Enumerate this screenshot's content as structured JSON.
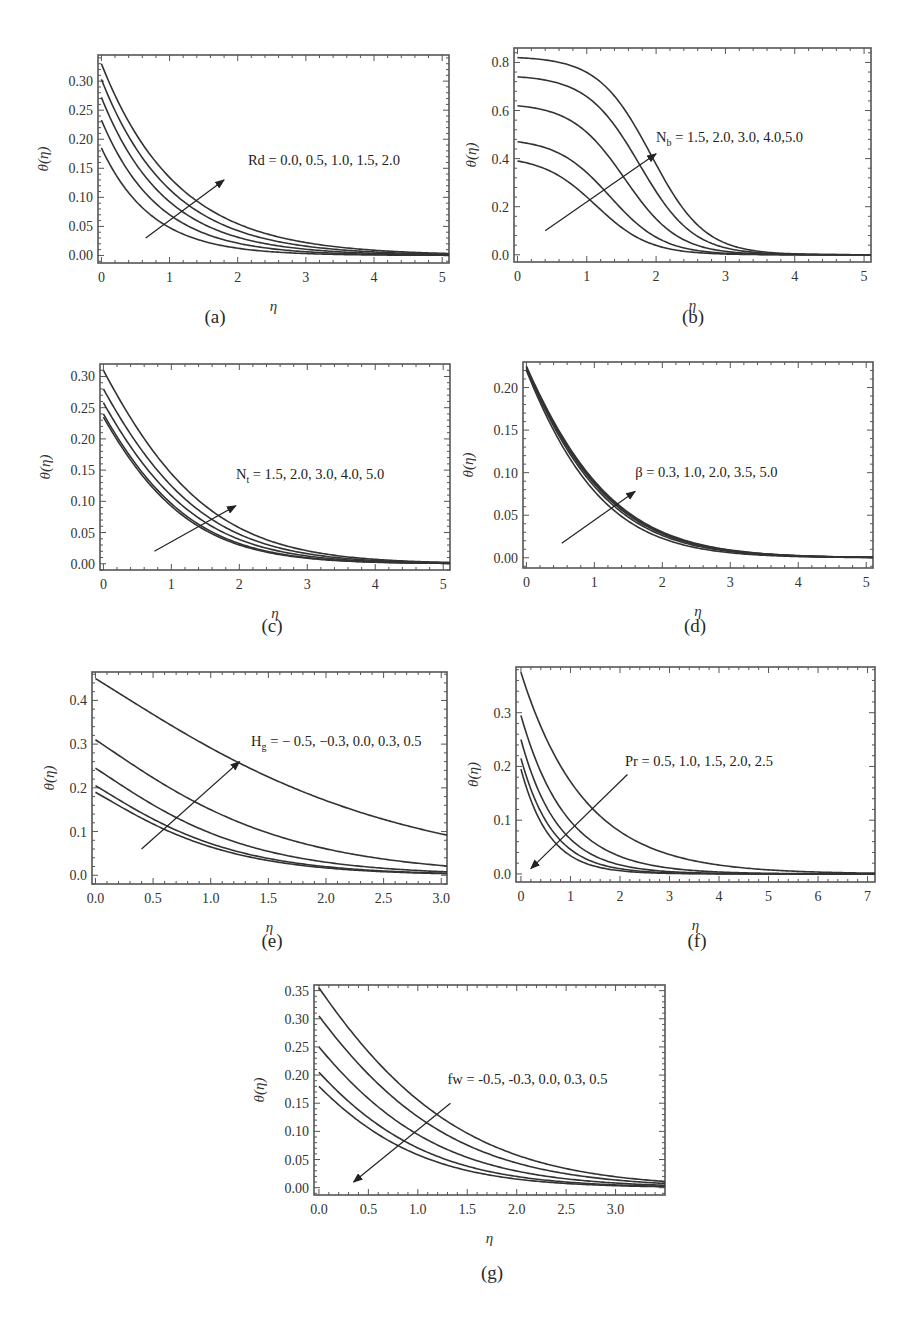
{
  "figure": {
    "captions": [
      "(a)",
      "(b)",
      "(c)",
      "(d)",
      "(e)",
      "(f)",
      "(g)"
    ]
  },
  "chart_data": [
    {
      "id": "a",
      "type": "line",
      "caption": "(a)",
      "xlabel": "η",
      "ylabel": "θ(η)",
      "frame": {
        "left": 98,
        "top": 55,
        "right": 449,
        "bottom": 263
      },
      "xlim": [
        -0.05,
        5.1
      ],
      "ylim": [
        -0.013,
        0.345
      ],
      "xticks": [
        0,
        1,
        2,
        3,
        4,
        5
      ],
      "xtick_labels": [
        "0",
        "1",
        "2",
        "3",
        "4",
        "5"
      ],
      "yticks": [
        0.0,
        0.05,
        0.1,
        0.15,
        0.2,
        0.25,
        0.3
      ],
      "ytick_labels": [
        "0.00",
        "0.05",
        "0.10",
        "0.15",
        "0.20",
        "0.25",
        "0.30"
      ],
      "legend": {
        "text": "Rd = 0.0, 0.5, 1.0, 1.5, 2.0",
        "x": 2.15,
        "y": 0.155,
        "sub": null
      },
      "arrow": {
        "from": [
          0.65,
          0.03
        ],
        "to": [
          1.8,
          0.13
        ],
        "direction": "increasing"
      },
      "parameter": "Rd",
      "parameter_values": [
        0.0,
        0.5,
        1.0,
        1.5,
        2.0
      ],
      "curve_model": "exp",
      "series": [
        {
          "name": "Rd = 0.0",
          "theta0": 0.185,
          "k": 1.35
        },
        {
          "name": "Rd = 0.5",
          "theta0": 0.233,
          "k": 1.2
        },
        {
          "name": "Rd = 1.0",
          "theta0": 0.272,
          "k": 1.08
        },
        {
          "name": "Rd = 1.5",
          "theta0": 0.303,
          "k": 0.98
        },
        {
          "name": "Rd = 2.0",
          "theta0": 0.33,
          "k": 0.9
        }
      ]
    },
    {
      "id": "b",
      "type": "line",
      "caption": "(b)",
      "xlabel": "η",
      "ylabel": "θ(η)",
      "frame": {
        "left": 514,
        "top": 48,
        "right": 871,
        "bottom": 262
      },
      "xlim": [
        -0.05,
        5.1
      ],
      "ylim": [
        -0.03,
        0.86
      ],
      "xticks": [
        0,
        1,
        2,
        3,
        4,
        5
      ],
      "xtick_labels": [
        "0",
        "1",
        "2",
        "3",
        "4",
        "5"
      ],
      "yticks": [
        0.0,
        0.2,
        0.4,
        0.6,
        0.8
      ],
      "ytick_labels": [
        "0.0",
        "0.2",
        "0.4",
        "0.6",
        "0.8"
      ],
      "legend": {
        "text": "N",
        "sub": "b",
        "rest": " = 1.5, 2.0, 3.0, 4.0,5.0",
        "x": 2.0,
        "y": 0.47
      },
      "arrow": {
        "from": [
          0.4,
          0.1
        ],
        "to": [
          2.0,
          0.42
        ],
        "direction": "increasing"
      },
      "parameter": "Nb",
      "parameter_values": [
        1.5,
        2.0,
        3.0,
        4.0,
        5.0
      ],
      "curve_model": "gauss",
      "series": [
        {
          "name": "Nb = 1.5",
          "theta0": 0.39,
          "k": 0.95
        },
        {
          "name": "Nb = 2.0",
          "theta0": 0.47,
          "k": 1.12
        },
        {
          "name": "Nb = 3.0",
          "theta0": 0.62,
          "k": 1.3
        },
        {
          "name": "Nb = 4.0",
          "theta0": 0.74,
          "k": 1.48
        },
        {
          "name": "Nb = 5.0",
          "theta0": 0.82,
          "k": 1.62
        }
      ]
    },
    {
      "id": "c",
      "type": "line",
      "caption": "(c)",
      "xlabel": "η",
      "ylabel": "θ(η)",
      "frame": {
        "left": 100,
        "top": 364,
        "right": 450,
        "bottom": 570
      },
      "xlim": [
        -0.05,
        5.1
      ],
      "ylim": [
        -0.01,
        0.32
      ],
      "xticks": [
        0,
        1,
        2,
        3,
        4,
        5
      ],
      "xtick_labels": [
        "0",
        "1",
        "2",
        "3",
        "4",
        "5"
      ],
      "yticks": [
        0.0,
        0.05,
        0.1,
        0.15,
        0.2,
        0.25,
        0.3
      ],
      "ytick_labels": [
        "0.00",
        "0.05",
        "0.10",
        "0.15",
        "0.20",
        "0.25",
        "0.30"
      ],
      "legend": {
        "text": "N",
        "sub": "t",
        "rest": " = 1.5, 2.0, 3.0, 4.0, 5.0",
        "x": 1.95,
        "y": 0.135
      },
      "arrow": {
        "from": [
          0.75,
          0.02
        ],
        "to": [
          1.95,
          0.093
        ],
        "direction": "increasing"
      },
      "parameter": "Nt",
      "parameter_values": [
        1.5,
        2.0,
        3.0,
        4.0,
        5.0
      ],
      "curve_model": "exp2",
      "series": [
        {
          "name": "Nt = 1.5",
          "theta0": 0.235,
          "k": 1.25
        },
        {
          "name": "Nt = 2.0",
          "theta0": 0.24,
          "k": 1.22
        },
        {
          "name": "Nt = 3.0",
          "theta0": 0.258,
          "k": 1.15
        },
        {
          "name": "Nt = 4.0",
          "theta0": 0.28,
          "k": 1.08
        },
        {
          "name": "Nt = 5.0",
          "theta0": 0.31,
          "k": 1.02
        }
      ]
    },
    {
      "id": "d",
      "type": "line",
      "caption": "(d)",
      "xlabel": "η",
      "ylabel": "θ(η)",
      "frame": {
        "left": 523,
        "top": 362,
        "right": 873,
        "bottom": 568
      },
      "xlim": [
        -0.05,
        5.1
      ],
      "ylim": [
        -0.012,
        0.23
      ],
      "xticks": [
        0,
        1,
        2,
        3,
        4,
        5
      ],
      "xtick_labels": [
        "0",
        "1",
        "2",
        "3",
        "4",
        "5"
      ],
      "yticks": [
        0.0,
        0.05,
        0.1,
        0.15,
        0.2
      ],
      "ytick_labels": [
        "0.00",
        "0.05",
        "0.10",
        "0.15",
        "0.20"
      ],
      "legend": {
        "text": "β = 0.3, 1.0, 2.0, 3.5, 5.0",
        "x": 1.6,
        "y": 0.095,
        "sub": null
      },
      "arrow": {
        "from": [
          0.52,
          0.017
        ],
        "to": [
          1.6,
          0.078
        ],
        "direction": "increasing"
      },
      "parameter": "β",
      "parameter_values": [
        0.3,
        1.0,
        2.0,
        3.5,
        5.0
      ],
      "curve_model": "exp2",
      "series": [
        {
          "name": "β = 0.3",
          "theta0": 0.22,
          "k": 1.38
        },
        {
          "name": "β = 1.0",
          "theta0": 0.222,
          "k": 1.3
        },
        {
          "name": "β = 2.0",
          "theta0": 0.223,
          "k": 1.26
        },
        {
          "name": "β = 3.5",
          "theta0": 0.224,
          "k": 1.24
        },
        {
          "name": "β = 5.0",
          "theta0": 0.225,
          "k": 1.22
        }
      ]
    },
    {
      "id": "e",
      "type": "line",
      "caption": "(e)",
      "xlabel": "η",
      "ylabel": "θ(η)",
      "frame": {
        "left": 92,
        "top": 672,
        "right": 447,
        "bottom": 884
      },
      "xlim": [
        -0.03,
        3.05
      ],
      "ylim": [
        -0.02,
        0.465
      ],
      "xticks": [
        0,
        0.5,
        1.0,
        1.5,
        2.0,
        2.5,
        3.0
      ],
      "xtick_labels": [
        "0.0",
        "0.5",
        "1.0",
        "1.5",
        "2.0",
        "2.5",
        "3.0"
      ],
      "yticks": [
        0.0,
        0.1,
        0.2,
        0.3,
        0.4
      ],
      "ytick_labels": [
        "0.0",
        "0.1",
        "0.2",
        "0.3",
        "0.4"
      ],
      "legend": {
        "text": "H",
        "sub": "g",
        "rest": " = − 0.5,  −0.3,  0.0,  0.3,  0.5",
        "x": 1.35,
        "y": 0.295
      },
      "arrow": {
        "from": [
          0.4,
          0.06
        ],
        "to": [
          1.25,
          0.26
        ],
        "direction": "increasing"
      },
      "parameter": "Hg",
      "parameter_values": [
        -0.5,
        -0.3,
        0.0,
        0.3,
        0.5
      ],
      "curve_model": "mix",
      "series": [
        {
          "name": "Hg = -0.5",
          "theta0": 0.19,
          "k": 1.75
        },
        {
          "name": "Hg = -0.3",
          "theta0": 0.205,
          "k": 1.7
        },
        {
          "name": "Hg = 0.0",
          "theta0": 0.245,
          "k": 1.55
        },
        {
          "name": "Hg = 0.3",
          "theta0": 0.31,
          "k": 1.25
        },
        {
          "name": "Hg = 0.5",
          "theta0": 0.45,
          "k": 0.8
        }
      ]
    },
    {
      "id": "f",
      "type": "line",
      "caption": "(f)",
      "xlabel": "η",
      "ylabel": "θ(η)",
      "frame": {
        "left": 516,
        "top": 667,
        "right": 875,
        "bottom": 882
      },
      "xlim": [
        -0.1,
        7.15
      ],
      "ylim": [
        -0.015,
        0.385
      ],
      "xticks": [
        0,
        1,
        2,
        3,
        4,
        5,
        6,
        7
      ],
      "xtick_labels": [
        "0",
        "1",
        "2",
        "3",
        "4",
        "5",
        "6",
        "7"
      ],
      "yticks": [
        0.0,
        0.1,
        0.2,
        0.3
      ],
      "ytick_labels": [
        "0.0",
        "0.1",
        "0.2",
        "0.3"
      ],
      "legend": {
        "text": "Pr = 0.5, 1.0, 1.5, 2.0, 2.5",
        "x": 2.1,
        "y": 0.2,
        "sub": null
      },
      "arrow": {
        "from": [
          2.15,
          0.185
        ],
        "to": [
          0.2,
          0.01
        ],
        "direction": "decreasing"
      },
      "parameter": "Pr",
      "parameter_values": [
        0.5,
        1.0,
        1.5,
        2.0,
        2.5
      ],
      "curve_model": "exp",
      "series": [
        {
          "name": "Pr = 0.5",
          "theta0": 0.375,
          "k": 0.78
        },
        {
          "name": "Pr = 1.0",
          "theta0": 0.295,
          "k": 1.1
        },
        {
          "name": "Pr = 1.5",
          "theta0": 0.25,
          "k": 1.35
        },
        {
          "name": "Pr = 2.0",
          "theta0": 0.215,
          "k": 1.55
        },
        {
          "name": "Pr = 2.5",
          "theta0": 0.195,
          "k": 1.75
        }
      ]
    },
    {
      "id": "g",
      "type": "line",
      "caption": "(g)",
      "xlabel": "η",
      "ylabel": "θ(η)",
      "frame": {
        "left": 314,
        "top": 985,
        "right": 665,
        "bottom": 1195
      },
      "xlim": [
        -0.05,
        3.5
      ],
      "ylim": [
        -0.013,
        0.36
      ],
      "xticks": [
        0,
        0.5,
        1.0,
        1.5,
        2.0,
        2.5,
        3.0
      ],
      "xtick_labels": [
        "0.0",
        "0.5",
        "1.0",
        "1.5",
        "2.0",
        "2.5",
        "3.0"
      ],
      "yticks": [
        0.0,
        0.05,
        0.1,
        0.15,
        0.2,
        0.25,
        0.3,
        0.35
      ],
      "ytick_labels": [
        "0.00",
        "0.05",
        "0.10",
        "0.15",
        "0.20",
        "0.25",
        "0.30",
        "0.35"
      ],
      "legend": {
        "text": "fw = -0.5, -0.3, 0.0, 0.3, 0.5",
        "x": 1.3,
        "y": 0.185,
        "sub": null
      },
      "arrow": {
        "from": [
          1.33,
          0.15
        ],
        "to": [
          0.35,
          0.01
        ],
        "direction": "decreasing"
      },
      "parameter": "fw",
      "parameter_values": [
        -0.5,
        -0.3,
        0.0,
        0.3,
        0.5
      ],
      "curve_model": "exp2",
      "series": [
        {
          "name": "fw = 0.5",
          "theta0": 0.18,
          "k": 1.5
        },
        {
          "name": "fw = 0.3",
          "theta0": 0.205,
          "k": 1.42
        },
        {
          "name": "fw = 0.0",
          "theta0": 0.25,
          "k": 1.3
        },
        {
          "name": "fw = -0.3",
          "theta0": 0.305,
          "k": 1.18
        },
        {
          "name": "fw = -0.5",
          "theta0": 0.355,
          "k": 1.1
        }
      ]
    }
  ],
  "captions_pos": [
    {
      "x": 215,
      "y": 306
    },
    {
      "x": 693,
      "y": 306
    },
    {
      "x": 272,
      "y": 615
    },
    {
      "x": 695,
      "y": 615
    },
    {
      "x": 272,
      "y": 930
    },
    {
      "x": 697,
      "y": 930
    },
    {
      "x": 492,
      "y": 1262
    }
  ],
  "style": {
    "curve_color": "#333333",
    "frame_color": "#555555",
    "arrow_color": "#222222"
  }
}
